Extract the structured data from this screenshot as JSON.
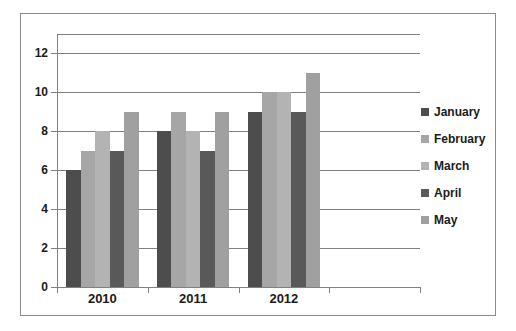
{
  "chart_data": {
    "type": "bar",
    "title": "",
    "subtitle": "",
    "xlabel": "",
    "ylabel": "",
    "categories": [
      "2010",
      "2011",
      "2012"
    ],
    "series": [
      {
        "name": "January",
        "values": [
          6,
          8,
          9
        ],
        "color": "#4d4d4d"
      },
      {
        "name": "February",
        "values": [
          7,
          9,
          10
        ],
        "color": "#a6a6a6"
      },
      {
        "name": "March",
        "values": [
          8,
          8,
          10
        ],
        "color": "#b3b3b3"
      },
      {
        "name": "April",
        "values": [
          7,
          7,
          9
        ],
        "color": "#595959"
      },
      {
        "name": "May",
        "values": [
          9,
          9,
          11
        ],
        "color": "#a0a0a0"
      }
    ],
    "ylim": [
      0,
      13
    ],
    "ytick_values": [
      0,
      2,
      4,
      6,
      8,
      10,
      12
    ],
    "ytick_labels": [
      "0",
      "2",
      "4",
      "6",
      "8",
      "10",
      "12"
    ],
    "grid": true,
    "grid_axis": "y",
    "legend_position": "right",
    "plot_background": "#ffffff",
    "grid_color": "#808080",
    "axis_color": "#808080",
    "text_color": "#1a1a1a",
    "frame_color": "#8c8c8c"
  }
}
